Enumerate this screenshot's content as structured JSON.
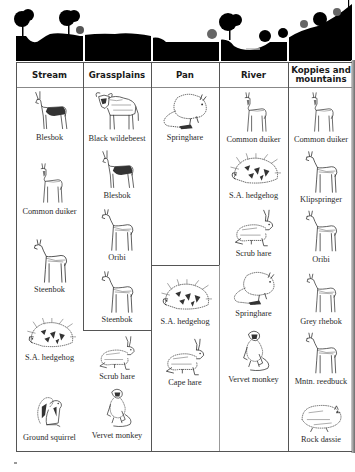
{
  "figure": {
    "landscape_sections": [
      "stream",
      "grassplains",
      "pan",
      "river",
      "koppies-and-mountains"
    ],
    "colors": {
      "silhouette": "#000000",
      "grid": "#555555",
      "text": "#2b2b2b",
      "background": "#ffffff"
    }
  },
  "table": {
    "headers": {
      "stream": "Stream",
      "grassplains": "Grassplains",
      "pan": "Pan",
      "river": "River",
      "koppies_line1": "Koppies and",
      "koppies_line2": "mountains"
    },
    "stream": [
      {
        "animal": "Blesbok",
        "icon": "antelope-icon"
      },
      {
        "animal": "Common duiker",
        "icon": "duiker-icon"
      },
      {
        "animal": "Steenbok",
        "icon": "small-antelope-icon"
      },
      {
        "animal": "S.A. hedgehog",
        "icon": "hedgehog-icon"
      },
      {
        "animal": "Ground squirrel",
        "icon": "squirrel-icon"
      }
    ],
    "grassplains": [
      {
        "animal": "Black wildebeest",
        "icon": "wildebeest-icon"
      },
      {
        "animal": "Blesbok",
        "icon": "antelope-icon"
      },
      {
        "animal": "Oribi",
        "icon": "small-antelope-icon"
      },
      {
        "animal": "Steenbok",
        "icon": "small-antelope-icon"
      },
      {
        "animal": "Scrub hare",
        "icon": "hare-icon"
      },
      {
        "animal": "Vervet monkey",
        "icon": "monkey-icon"
      }
    ],
    "pan": [
      {
        "animal": "Springhare",
        "icon": "springhare-icon"
      },
      {
        "animal": "S.A. hedgehog",
        "icon": "hedgehog-icon"
      },
      {
        "animal": "Cape hare",
        "icon": "hare-icon"
      }
    ],
    "river": [
      {
        "animal": "Common duiker",
        "icon": "duiker-icon"
      },
      {
        "animal": "S.A. hedgehog",
        "icon": "hedgehog-icon"
      },
      {
        "animal": "Scrub hare",
        "icon": "hare-icon"
      },
      {
        "animal": "Springhare",
        "icon": "springhare-icon"
      },
      {
        "animal": "Vervet monkey",
        "icon": "monkey-icon"
      }
    ],
    "koppies": [
      {
        "animal": "Common duiker",
        "icon": "duiker-icon"
      },
      {
        "animal": "Klipspringer",
        "icon": "small-antelope-icon"
      },
      {
        "animal": "Oribi",
        "icon": "small-antelope-icon"
      },
      {
        "animal": "Grey rhebok",
        "icon": "small-antelope-icon"
      },
      {
        "animal": "Mntn. reedbuck",
        "icon": "small-antelope-icon"
      },
      {
        "animal": "Rock dassie",
        "icon": "dassie-icon"
      }
    ]
  }
}
